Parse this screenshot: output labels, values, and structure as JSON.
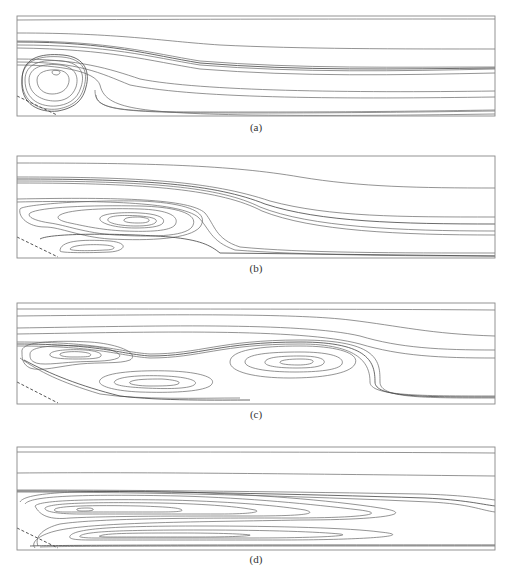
{
  "figure": {
    "panels": [
      {
        "label": "(a)",
        "top": 15,
        "height": 101,
        "caption_top": 121,
        "frame": {
          "x": 17,
          "y": 1,
          "w": 478,
          "h": 100
        },
        "inlet": "M17,81 L57,100",
        "streamlines": [
          "M17,5 C200,4 350,4 495,4",
          "M17,18 C120,18 160,26 220,30 C300,34 400,34 495,34",
          "M17,26 C110,26 150,38 200,46 C300,54 400,52 495,52",
          "M17,30 C110,30 150,42 200,50 C300,58 400,56 495,54",
          "M17,33 C110,34 150,46 200,54 C300,62 400,60 495,58",
          "M17,44 C80,44 110,54 140,64 C200,76 350,78 495,76",
          "M17,47 C80,47 100,58 130,70 C200,84 350,84 495,82",
          "M17,50 C60,50 95,56 100,70 C105,92 130,98 250,100 C350,101 420,100 495,99",
          "M95,75 C95,95 110,98 250,98 C350,98 420,97 495,96",
          "M96,80 C97,98 140,97 260,97 C360,97 430,96 495,95",
          "M22,65 C22,45 40,40 62,42 C85,44 88,58 84,72 C80,88 68,92 58,94 C40,96 22,88 22,65 Z",
          "M25,65 C25,48 42,44 62,46 C82,48 85,60 81,72 C77,86 66,90 56,91 C42,92 25,86 25,65 Z",
          "M29,65 C29,52 44,48 60,50 C76,52 79,62 76,72 C72,83 63,86 55,86 C43,86 29,80 29,65 Z",
          "M37,65 C37,57 47,54 58,55 C68,56 71,63 68,70 C65,77 58,79 52,79 C44,79 37,74 37,65 Z",
          "M52,57 C52,55 57,55 59,56 C61,57 60,59 57,60 C54,60 52,59 52,57 Z"
        ],
        "dark_streamlines": [
          "M17,27 C110,27 150,40 200,48 C300,56 400,54 495,53",
          "M22,65 C22,43 40,38 63,40 C86,42 90,58 86,72 C82,90 68,94 58,96 C40,98 20,90 22,65 Z"
        ]
      },
      {
        "label": "(b)",
        "top": 155,
        "height": 103,
        "caption_top": 262,
        "frame": {
          "x": 17,
          "y": 1,
          "w": 478,
          "h": 102
        },
        "inlet": "M17,82 L58,102",
        "streamlines": [
          "M17,8 C150,8 230,10 300,22 C360,32 420,33 495,33",
          "M17,22 C140,22 210,26 270,46 C330,62 400,62 495,62",
          "M17,26 C150,26 220,32 260,52 C310,72 400,76 495,76",
          "M17,28 C150,28 222,35 262,56 C312,76 400,80 495,80",
          "M17,44 C120,42 190,44 205,58 C215,70 215,84 240,92 C300,98 400,98 495,98",
          "M17,47 C110,45 180,48 198,62 C210,74 210,86 235,95 C300,100 400,101 495,101",
          "M20,54 C22,50 80,45 140,46 C190,48 210,58 200,72 C190,84 150,86 110,84 C80,82 60,72 45,72 C28,72 18,62 20,54 Z",
          "M30,58 C40,52 90,50 140,51 C180,52 200,60 192,72 C184,82 150,82 115,80 C85,78 65,70 50,68 C36,66 26,62 30,58 Z",
          "M60,60 C70,54 110,53 140,54 C170,55 180,62 175,70 C170,76 150,77 125,76 C100,75 80,70 70,68 C60,66 55,63 60,60 Z",
          "M100,63 C102,58 125,57 140,58 C158,59 166,63 163,68 C160,72 148,73 135,73 C115,73 98,68 100,63 Z",
          "M108,64 C110,60 127,60 140,61 C152,62 158,64 156,67 C154,70 146,71 136,71 C120,71 106,68 108,64 Z",
          "M124,65 C125,62 134,62 140,62 C147,63 150,64 149,66 C147,68 142,68 137,68 C130,68 123,67 124,65 Z",
          "M60,96 C60,86 80,84 110,86 C130,88 125,96 110,97 C90,98 60,98 60,96 Z",
          "M70,94 C72,90 90,89 105,90 C118,91 116,95 105,95 C90,96 70,96 70,94 Z"
        ],
        "dark_streamlines": [
          "M17,24 C145,24 215,29 265,49 C320,67 400,69 495,69",
          "M40,84 C50,78 120,78 170,82 C200,85 210,90 220,98 L495,101"
        ]
      },
      {
        "label": "(c)",
        "top": 302,
        "height": 103,
        "caption_top": 408,
        "frame": {
          "x": 17,
          "y": 1,
          "w": 478,
          "h": 101
        },
        "inlet": "M17,80 L58,101",
        "streamlines": [
          "M17,7 C200,7 350,7 495,8",
          "M17,14 C200,12 300,12 350,18 C400,24 430,32 495,34",
          "M17,26 C150,24 300,20 360,34 C400,46 440,48 495,48",
          "M17,32 C150,30 300,26 360,42 C400,54 440,56 495,56",
          "M17,40 C100,40 120,50 150,52 C200,52 220,38 300,38 C380,38 380,60 380,80 C380,96 420,96 495,96",
          "M17,44 C100,44 120,54 150,56 C200,56 220,42 300,42 C360,42 370,62 370,80 C370,94 420,94 495,94",
          "M22,50 C20,40 50,38 90,40 C120,42 140,52 130,58 C120,62 100,60 80,62 C60,64 40,70 30,66 C22,62 22,56 22,50 Z",
          "M30,52 C30,44 55,43 85,44 C110,45 125,52 118,56 C110,60 90,59 75,60 C58,61 40,64 34,60 C30,58 30,55 30,52 Z",
          "M50,52 C52,48 70,47 85,48 C98,49 104,52 100,55 C96,57 85,57 75,57 C62,57 48,56 50,52 Z",
          "M60,52 C62,50 72,49 82,50 C90,51 92,52 90,54 C88,55 80,55 72,55 C66,55 59,54 60,52 Z",
          "M230,60 C230,48 260,44 300,44 C340,44 360,52 355,62 C350,72 320,76 290,76 C255,76 230,70 230,60 Z",
          "M245,60 C245,52 270,50 300,50 C330,50 345,55 342,62 C339,68 318,70 295,70 C265,70 245,66 245,60 Z",
          "M265,60 C266,55 282,54 300,54 C318,54 326,57 324,61 C322,65 310,66 296,66 C278,66 264,64 265,60 Z",
          "M280,60 C281,58 290,57 300,57 C310,57 314,58 313,60 C312,62 305,63 298,63 C288,63 279,62 280,60 Z",
          "M100,78 C105,70 140,68 170,69 C200,70 220,76 210,84 C200,90 170,91 140,90 C115,89 96,84 100,78 Z",
          "M115,79 C120,74 145,73 165,74 C188,75 200,79 194,83 C188,87 165,87 145,86 C125,85 111,83 115,79 Z",
          "M130,80 C134,77 150,77 162,77 C176,78 182,80 178,82 C174,84 160,84 150,84 C138,84 127,82 130,80 Z",
          "M20,56 C40,70 60,80 100,92 C140,98 200,96 240,96"
        ],
        "dark_streamlines": [
          "M17,42 C100,42 120,52 150,54 C200,54 220,40 300,40 C370,40 375,61 375,80 C375,95 420,95 495,95",
          "M24,58 C50,72 80,84 120,94 C160,99 220,98 250,98"
        ]
      },
      {
        "label": "(d)",
        "top": 446,
        "height": 104,
        "caption_top": 553,
        "frame": {
          "x": 17,
          "y": 1,
          "w": 478,
          "h": 103
        },
        "inlet": "M17,82 L58,102",
        "streamlines": [
          "M17,6 C200,6 350,6 495,7",
          "M17,27 C150,26 300,28 495,30",
          "M17,44 C150,44 300,46 420,48 C460,49 480,52 495,54",
          "M17,46 C150,46 300,50 430,56 C470,58 480,64 495,66",
          "M20,56 C25,46 80,44 180,46 C250,48 330,54 380,62 C420,68 380,74 300,74 C200,76 100,76 60,84 C40,88 30,96 35,102",
          "M25,58 C30,50 80,48 180,50 C250,52 310,58 360,64 C390,68 360,72 290,72 C200,72 100,72 60,78 C44,82 34,90 38,100",
          "M35,60 C40,54 90,53 170,54 C240,56 280,60 305,64 C320,68 300,70 250,70 C180,70 110,70 70,72 C50,74 40,70 35,60 Z",
          "M45,62 C50,57 90,56 160,57 C210,58 240,61 255,64 C262,66 250,68 220,68 C170,68 110,68 80,68 C60,68 44,66 45,62 Z",
          "M55,63 C60,60 90,59 140,60 C170,61 180,62 182,64 C183,66 170,66 150,66 C110,66 80,66 65,66 C56,66 53,65 55,63 Z",
          "M77,63 C79,62 84,62 88,62 C92,62 94,63 93,64 C91,65 86,65 82,65 C78,65 76,64 77,63 Z",
          "M70,90 C75,82 120,80 200,80 C280,80 350,82 380,86 C420,90 360,94 280,94 C200,94 120,94 90,94 C75,94 68,93 70,90 Z",
          "M80,90 C85,85 130,84 200,84 C270,84 320,86 340,88 C355,90 310,92 250,92 C180,92 120,92 95,92 C84,92 78,91 80,90 Z",
          "M100,90 C104,87 140,87 180,87 C220,87 245,88 250,89 C252,90 230,91 200,91 C160,91 120,91 108,91 C100,91 98,90 100,90 Z",
          "M40,101 C60,100 200,100 495,100"
        ],
        "dark_streamlines": [
          "M17,45 C150,45 300,48 425,52 C465,54 480,58 495,60",
          "M30,100 C60,99 200,99 495,99"
        ]
      }
    ]
  }
}
